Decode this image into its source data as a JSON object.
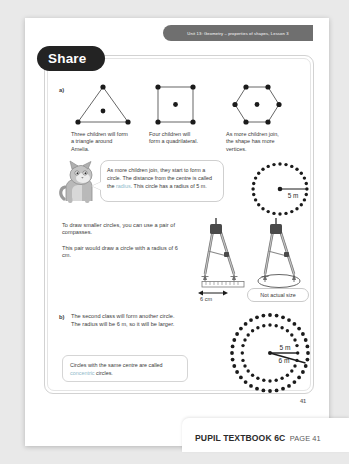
{
  "banner": {
    "unit_text": "Unit 13: Geometry – properties of shapes, Lesson 3"
  },
  "share": {
    "label": "Share"
  },
  "part_a": {
    "label": "a)",
    "shapes": [
      {
        "name": "triangle",
        "vertices": 3
      },
      {
        "name": "square",
        "vertices": 4
      },
      {
        "name": "hexagon",
        "vertices": 6
      }
    ],
    "captions": [
      "Three children will form a triangle around Amelia.",
      "Four children will form a quadrilateral.",
      "As more children join, the shape has more vertices."
    ]
  },
  "speech_bubble": {
    "line1": "As more children join, they start",
    "line2": "to form a circle. The distance from",
    "line3_pre": "the centre is called the ",
    "line3_hl": "radius",
    "line3_post": ".",
    "line4": "This circle has a radius of 5 m."
  },
  "circle_one": {
    "radius_label": "5 m"
  },
  "compasses": {
    "para1": "To draw smaller circles, you can use a pair of compasses.",
    "para2": "This pair would draw a circle with a radius of 6 cm.",
    "ruler_label": "6 cm",
    "not_actual_size": "Not actual size"
  },
  "part_b": {
    "label": "b)",
    "line1": "The second class will form another circle.",
    "line2": "The radius will be 6 m, so it will be larger.",
    "note_pre": "Circles with the same centre are called ",
    "note_hl": "concentric",
    "note_post": " circles."
  },
  "concentric": {
    "inner_label": "5 m",
    "outer_label": "6 m"
  },
  "footer": {
    "page_number": "41",
    "book": "PUPIL TEXTBOOK 6C",
    "page_label": "PAGE 41"
  },
  "colors": {
    "highlight": "#8fb9c9",
    "banner": "#6f6f6f",
    "share_pill": "#232323",
    "ink": "#3b3b3b"
  }
}
